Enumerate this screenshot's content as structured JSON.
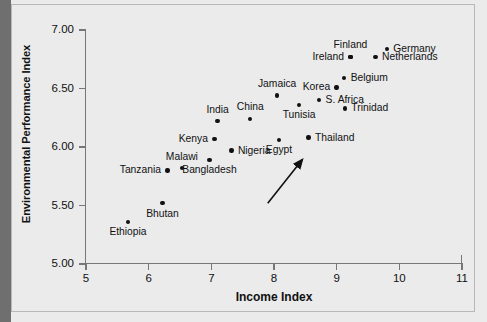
{
  "chart_data": {
    "type": "scatter",
    "title": "",
    "xlabel": "Income Index",
    "ylabel": "Environmental Performance Index",
    "xlim": [
      5,
      11
    ],
    "ylim": [
      5.0,
      7.0
    ],
    "xticks": [
      "5",
      "6",
      "7",
      "8",
      "9",
      "10",
      "11"
    ],
    "yticks": [
      "5.00",
      "5.50",
      "6.00",
      "6.50",
      "7.00"
    ],
    "grid": false,
    "legend": null,
    "annotations": [
      {
        "name": "trend-arrow",
        "type": "arrow",
        "from": [
          7.9,
          5.52
        ],
        "to": [
          8.45,
          5.89
        ]
      }
    ],
    "points": [
      {
        "label": "Ethiopia",
        "x": 5.67,
        "y": 5.36,
        "label_pos": "below"
      },
      {
        "label": "Bhutan",
        "x": 6.22,
        "y": 5.52,
        "label_pos": "below"
      },
      {
        "label": "Tanzania",
        "x": 6.3,
        "y": 5.8,
        "label_pos": "left"
      },
      {
        "label": "Malawi",
        "x": 6.53,
        "y": 5.82,
        "label_pos": "above"
      },
      {
        "label": "Bangladesh",
        "x": 6.97,
        "y": 5.89,
        "label_pos": "below"
      },
      {
        "label": "Kenya",
        "x": 7.05,
        "y": 6.07,
        "label_pos": "left"
      },
      {
        "label": "India",
        "x": 7.1,
        "y": 6.22,
        "label_pos": "above"
      },
      {
        "label": "Nigeria",
        "x": 7.32,
        "y": 5.97,
        "label_pos": "right"
      },
      {
        "label": "China",
        "x": 7.62,
        "y": 6.24,
        "label_pos": "above"
      },
      {
        "label": "Jamaica",
        "x": 8.05,
        "y": 6.44,
        "label_pos": "above"
      },
      {
        "label": "Egypt",
        "x": 8.08,
        "y": 6.06,
        "label_pos": "below"
      },
      {
        "label": "Tunisia",
        "x": 8.4,
        "y": 6.36,
        "label_pos": "below"
      },
      {
        "label": "Thailand",
        "x": 8.55,
        "y": 6.08,
        "label_pos": "right"
      },
      {
        "label": "S. Africa",
        "x": 8.72,
        "y": 6.4,
        "label_pos": "right"
      },
      {
        "label": "Korea",
        "x": 9.0,
        "y": 6.51,
        "label_pos": "left"
      },
      {
        "label": "Trinidad",
        "x": 9.13,
        "y": 6.33,
        "label_pos": "right"
      },
      {
        "label": "Belgium",
        "x": 9.12,
        "y": 6.59,
        "label_pos": "right"
      },
      {
        "label": "Ireland",
        "x": 9.22,
        "y": 6.77,
        "label_pos": "left"
      },
      {
        "label": "Finland",
        "x": 9.22,
        "y": 6.77,
        "label_pos": "above"
      },
      {
        "label": "Netherlands",
        "x": 9.62,
        "y": 6.77,
        "label_pos": "right"
      },
      {
        "label": "Germany",
        "x": 9.8,
        "y": 6.84,
        "label_pos": "right"
      }
    ]
  },
  "axes": {
    "x_title": "Income Index",
    "y_title": "Environmental Performance Index"
  }
}
